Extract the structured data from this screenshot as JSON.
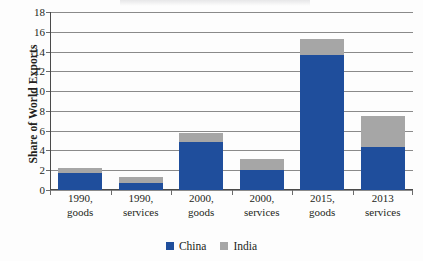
{
  "chart_data": {
    "type": "bar",
    "subtype": "stacked-vertical",
    "title": "",
    "xlabel": "",
    "ylabel": "Share of World Exports",
    "ylim": [
      0,
      18
    ],
    "ytick_step": 2,
    "yticks": [
      "18",
      "16",
      "14",
      "12",
      "10",
      "8",
      "6",
      "4",
      "2",
      "0"
    ],
    "grid": true,
    "grid_axis": "y",
    "legend_position": "bottom-center",
    "categories": [
      [
        "1990,",
        "goods"
      ],
      [
        "1990,",
        "services"
      ],
      [
        "2000,",
        "goods"
      ],
      [
        "2000,",
        "services"
      ],
      [
        "2015,",
        "goods"
      ],
      [
        "2013",
        "services"
      ]
    ],
    "series": [
      {
        "name": "China",
        "color": "#1f4e9c",
        "values": [
          1.7,
          0.7,
          4.9,
          2.0,
          13.7,
          4.4
        ]
      },
      {
        "name": "India",
        "color": "#a6a6a6",
        "values": [
          0.5,
          0.6,
          0.9,
          1.1,
          1.6,
          3.1
        ]
      }
    ],
    "stack_totals": [
      2.2,
      1.3,
      5.8,
      3.1,
      15.3,
      7.5
    ]
  },
  "legend": {
    "items": [
      {
        "label": "China",
        "swatch": "legend-swatch-china"
      },
      {
        "label": "India",
        "swatch": "legend-swatch-india"
      }
    ]
  },
  "colors": {
    "china": "#1f4e9c",
    "india": "#a6a6a6",
    "grid": "#8a8a8a",
    "axis": "#4a4a4a",
    "text": "#231f20",
    "background": "#ffffff"
  }
}
